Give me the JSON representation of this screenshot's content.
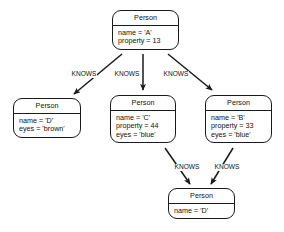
{
  "diagram": {
    "type": "property-graph",
    "background_color": "#ffffff",
    "stroke_color": "#1a1a1a",
    "text_color": "#111111",
    "nodes": [
      {
        "id": "a",
        "label": "Person",
        "properties": [
          "name = 'A'",
          "property = 13"
        ],
        "x": 112,
        "y": 10,
        "width": 67,
        "height": 43
      },
      {
        "id": "d_left",
        "label": "Person",
        "properties": [
          "name = 'D'",
          "eyes = 'brown'"
        ],
        "x": 13,
        "y": 98,
        "width": 68,
        "height": 43
      },
      {
        "id": "c",
        "label": "Person",
        "properties": [
          "name = 'C'",
          "property = 44",
          "eyes = 'blue'"
        ],
        "x": 110,
        "y": 95,
        "width": 66,
        "height": 52
      },
      {
        "id": "b",
        "label": "Person",
        "properties": [
          "name = 'B'",
          "property = 33",
          "eyes = 'blue'"
        ],
        "x": 205,
        "y": 95,
        "width": 67,
        "height": 52
      },
      {
        "id": "d_bottom",
        "label": "Person",
        "properties": [
          "name = 'D'"
        ],
        "x": 168,
        "y": 188,
        "width": 67,
        "height": 31
      }
    ],
    "edges": [
      {
        "id": "a-d",
        "label": "KNOWS",
        "from": "a",
        "to": "d_left",
        "label_x": 71,
        "label_y": 71
      },
      {
        "id": "a-c",
        "label": "KNOWS",
        "from": "a",
        "to": "c",
        "label_x": 114,
        "label_y": 71
      },
      {
        "id": "a-b",
        "label": "KNOWS",
        "from": "a",
        "to": "b",
        "label_x": 163,
        "label_y": 71
      },
      {
        "id": "c-d",
        "label": "KNOWS",
        "from": "c",
        "to": "d_bottom",
        "label_x": 174,
        "label_y": 164
      },
      {
        "id": "b-d",
        "label": "KNOWS",
        "from": "b",
        "to": "d_bottom",
        "label_x": 214,
        "label_y": 164
      }
    ]
  }
}
